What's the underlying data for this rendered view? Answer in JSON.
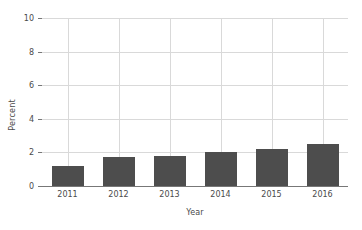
{
  "chart_data": {
    "type": "bar",
    "title": "",
    "subtitle": "",
    "xlabel": "Year",
    "ylabel": "Percent",
    "categories": [
      "2011",
      "2012",
      "2013",
      "2014",
      "2015",
      "2016"
    ],
    "values": [
      1.2,
      1.7,
      1.8,
      2.0,
      2.2,
      2.5
    ],
    "series": [
      {
        "name": "Percent",
        "values": [
          1.2,
          1.7,
          1.8,
          2.0,
          2.2,
          2.5
        ]
      }
    ],
    "ylim": [
      0,
      10
    ],
    "yticks": [
      0,
      2,
      4,
      6,
      8,
      10
    ],
    "ytick_labels": [
      "0",
      "2",
      "4",
      "6",
      "8",
      "10"
    ],
    "xtick_labels": [
      "2011",
      "2012",
      "2013",
      "2014",
      "2015",
      "2016"
    ],
    "grid": true,
    "grid_horizontal": true,
    "grid_vertical": true,
    "legend": false,
    "legend_position": "none",
    "bar_color": "#4d4d4d",
    "grid_color": "#d9d9d9",
    "axis_color": "#777777",
    "text_color": "#4a4a4a",
    "background_color": "#ffffff"
  }
}
